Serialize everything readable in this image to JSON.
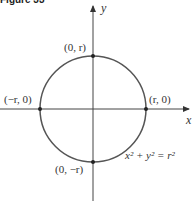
{
  "figure": {
    "label": "Figure 33",
    "axes": {
      "x_label": "x",
      "y_label": "y"
    },
    "points": {
      "top": "(0, r)",
      "left": "(−r, 0)",
      "right": "(r, 0)",
      "bottom": "(0, −r)"
    },
    "equation": "x² + y² = r²",
    "colors": {
      "curve": "#555555",
      "axes": "#444444",
      "text": "#333333"
    }
  }
}
